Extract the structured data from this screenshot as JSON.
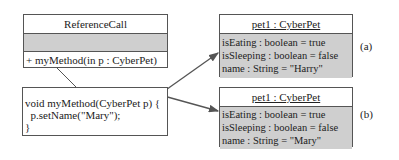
{
  "class_box": {
    "name": "ReferenceCall",
    "attributes": "",
    "operations": [
      "+ myMethod(in p : CyberPet)"
    ]
  },
  "method_note": {
    "lines": [
      "void myMethod(CyberPet p) {",
      "  p.setName(\"Mary\");",
      "}"
    ]
  },
  "objects": [
    {
      "title": "pet1 : CyberPet",
      "label": "(a)",
      "attributes": [
        "isEating : boolean  =  true",
        "isSleeping : boolean  =  false",
        "name : String  =  \"Harry\""
      ]
    },
    {
      "title": "pet1 : CyberPet",
      "label": "(b)",
      "attributes": [
        "isEating : boolean  =  true",
        "isSleeping : boolean  =  false",
        "name : String  =  \"Mary\""
      ]
    }
  ],
  "colors": {
    "compartment_fill": "#cfcfcf",
    "line": "#555555"
  }
}
